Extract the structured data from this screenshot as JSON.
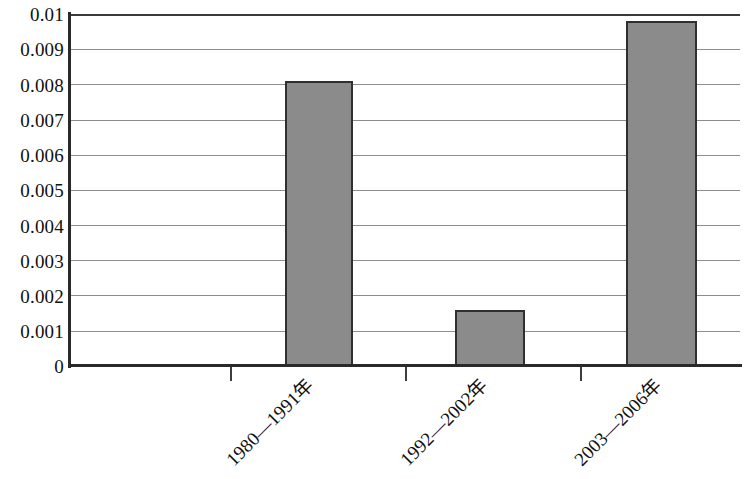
{
  "chart_data": {
    "type": "bar",
    "title": "",
    "subtitle": "",
    "xlabel": "",
    "ylabel": "",
    "categories": [
      "1980—1991年",
      "1992—2002年",
      "2003—2006年"
    ],
    "values": [
      0.0081,
      0.0016,
      0.0098
    ],
    "ylim": [
      0,
      0.01
    ],
    "ytick_labels": [
      "0.01",
      "0.009",
      "0.008",
      "0.007",
      "0.006",
      "0.005",
      "0.004",
      "0.003",
      "0.002",
      "0.001",
      "0"
    ],
    "ytick_values": [
      0.01,
      0.009,
      0.008,
      0.007,
      0.006,
      0.005,
      0.004,
      0.003,
      0.002,
      0.001,
      0
    ],
    "grid": true,
    "grid_axis": "y",
    "legend": null,
    "legend_position": "none",
    "annotations": [],
    "series": [
      {
        "name": "",
        "values": [
          0.0081,
          0.0016,
          0.0098
        ]
      }
    ],
    "bar_fill_color": "#8b8b8b",
    "bar_border_color": "#2f2f2f",
    "grid_color": "#8d8d8d",
    "axis_color": "#2a2a2a",
    "background_color": "#ffffff",
    "xtick_positions_px": [
      230,
      405,
      580
    ],
    "xlabel_rotation_deg": -45
  }
}
